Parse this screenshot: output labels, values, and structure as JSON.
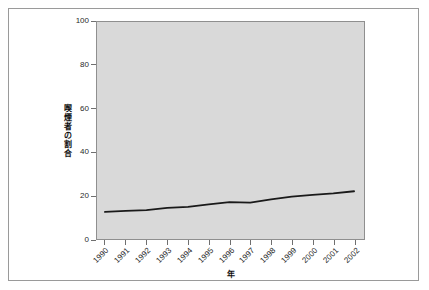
{
  "chart_data": {
    "type": "line",
    "title": "",
    "xlabel": "年",
    "ylabel": "喫煙者の割合",
    "ylabel_chars": [
      "喫",
      "煙",
      "者",
      "の",
      "割",
      "合"
    ],
    "categories": [
      "1990",
      "1991",
      "1992",
      "1993",
      "1994",
      "1995",
      "1996",
      "1997",
      "1998",
      "1999",
      "2000",
      "2001",
      "2002"
    ],
    "x": [
      1990,
      1991,
      1992,
      1993,
      1994,
      1995,
      1996,
      1997,
      1998,
      1999,
      2000,
      2001,
      2002
    ],
    "values": [
      12.5,
      13.0,
      13.3,
      14.3,
      14.8,
      16.0,
      17.0,
      16.8,
      18.3,
      19.5,
      20.3,
      21.0,
      22.0
    ],
    "series": [
      {
        "name": "喫煙者の割合",
        "values": [
          12.5,
          13.0,
          13.3,
          14.3,
          14.8,
          16.0,
          17.0,
          16.8,
          18.3,
          19.5,
          20.3,
          21.0,
          22.0
        ],
        "color": "#1a1a1a"
      }
    ],
    "ylim": [
      0,
      100
    ],
    "xlim": [
      1990,
      2002
    ],
    "yticks": [
      0,
      20,
      40,
      60,
      80,
      100
    ],
    "ytick_labels": [
      "0",
      "20",
      "40",
      "60",
      "80",
      "100"
    ],
    "xtick_labels": [
      "1990",
      "1991",
      "1992",
      "1993",
      "1994",
      "1995",
      "1996",
      "1997",
      "1998",
      "1999",
      "2000",
      "2001",
      "2002"
    ],
    "grid": false,
    "legend": "none",
    "plot_background": "#d9d9d9",
    "figure_background": "#ffffff",
    "axis_color": "#8f8f8f",
    "line_color": "#1a1a1a",
    "line_width": 1.8
  }
}
